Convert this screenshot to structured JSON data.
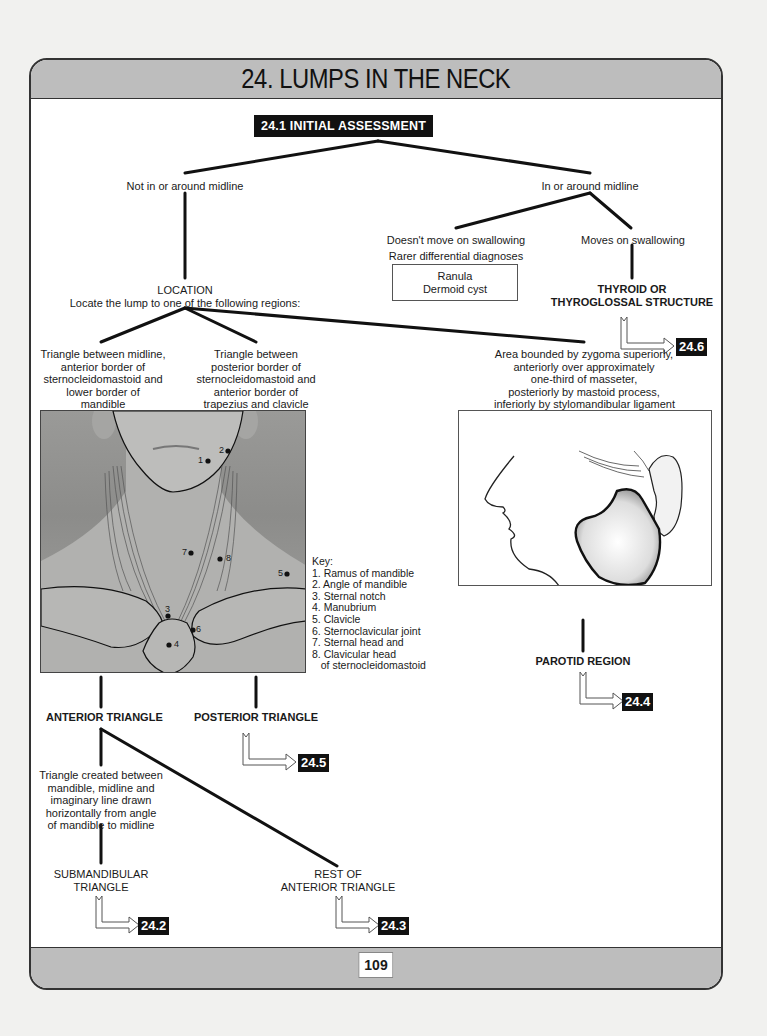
{
  "chapter": {
    "title": "24. LUMPS IN THE NECK",
    "page_number": "109"
  },
  "flowchart": {
    "root": "24.1 INITIAL ASSESSMENT",
    "not_midline": "Not in or around midline",
    "midline": "In or around midline",
    "doesnt_move": "Doesn't move on swallowing",
    "moves": "Moves on swallowing",
    "rarer_label": "Rarer differential diagnoses",
    "rarer_items": [
      "Ranula",
      "Dermoid cyst"
    ],
    "thyroid": [
      "THYROID OR",
      "THYROGLOSSAL STRUCTURE"
    ],
    "thyroid_ref": "24.6",
    "location_title": "LOCATION",
    "location_sub": "Locate the lump to one of the following regions:",
    "region_anterior_desc": [
      "Triangle between midline,",
      "anterior border of",
      "sternocleidomastoid and",
      "lower border of",
      "mandible"
    ],
    "region_posterior_desc": [
      "Triangle between",
      "posterior border of",
      "sternocleidomastoid and",
      "anterior border of",
      "trapezius and clavicle"
    ],
    "region_parotid_desc": [
      "Area bounded by zygoma superiorly,",
      "anteriorly over approximately",
      "one-third of masseter,",
      "posteriorly by mastoid process,",
      "inferiorly by stylomandibular ligament"
    ],
    "anterior_triangle": "ANTERIOR TRIANGLE",
    "posterior_triangle": "POSTERIOR TRIANGLE",
    "posterior_ref": "24.5",
    "parotid_region": "PAROTID REGION",
    "parotid_ref": "24.4",
    "submandibular_desc": [
      "Triangle created between",
      "mandible, midline and",
      "imaginary line drawn",
      "horizontally from angle",
      "of mandible to midline"
    ],
    "submandibular": [
      "SUBMANDIBULAR",
      "TRIANGLE"
    ],
    "submandibular_ref": "24.2",
    "rest_anterior": [
      "REST OF",
      "ANTERIOR TRIANGLE"
    ],
    "rest_anterior_ref": "24.3"
  },
  "photo": {
    "point_labels": [
      "1",
      "2",
      "3",
      "4",
      "5",
      "6",
      "7",
      "8"
    ]
  },
  "key": {
    "title": "Key:",
    "items": [
      "1. Ramus of mandible",
      "2. Angle of mandible",
      "3. Sternal notch",
      "4. Manubrium",
      "5. Clavicle",
      "6. Sternoclavicular joint",
      "7. Sternal head and",
      "8. Clavicular head",
      "   of sternocleidomastoid"
    ]
  },
  "colors": {
    "band_gray": "#bdbdbd",
    "badge_black": "#111111",
    "line": "#111111"
  }
}
